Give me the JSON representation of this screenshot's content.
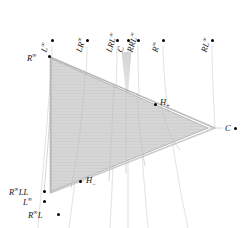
{
  "figure": {
    "width": 242,
    "height": 228,
    "background": "#ffffff",
    "fill_color": "#d4d4d4",
    "edge_color": "#9a9a9a",
    "curve_color": "#e2e2e2",
    "dot_color": "#000000",
    "wedge_color": "#d8d8d8"
  },
  "labels": {
    "top_row": [
      {
        "id": "L-inf",
        "base": "L",
        "sup": "∞",
        "sub": "",
        "x": 52,
        "y": 40
      },
      {
        "id": "LR-inf",
        "base": "LR",
        "sup": "∞",
        "sub": "",
        "x": 87,
        "y": 40
      },
      {
        "id": "LRL-inf",
        "base": "LRL",
        "sup": "∞",
        "sub": "",
        "x": 117,
        "y": 40
      },
      {
        "id": "C",
        "base": "C",
        "sup": "",
        "sub": "",
        "x": 128,
        "y": 40
      },
      {
        "id": "RRL-inf",
        "base": "RRL",
        "sup": "∞",
        "sub": "",
        "x": 138,
        "y": 40
      },
      {
        "id": "R-inf-top",
        "base": "R",
        "sup": "∞",
        "sub": "",
        "x": 163,
        "y": 40
      },
      {
        "id": "RL-inf",
        "base": "RL",
        "sup": "∞",
        "sub": "",
        "x": 212,
        "y": 40
      }
    ],
    "vertices": [
      {
        "id": "R-inf-vertex",
        "base": "R",
        "sup": "∞",
        "sub": "",
        "x": 44,
        "y": 57
      },
      {
        "id": "C-right",
        "base": "C",
        "sup": "",
        "sub": "",
        "x": 226,
        "y": 129
      }
    ],
    "interior": [
      {
        "id": "H-plus",
        "base": "H",
        "sup": "",
        "sub": "+",
        "x": 156,
        "y": 104
      },
      {
        "id": "H-minus",
        "base": "H",
        "sup": "",
        "sub": "−",
        "x": 82,
        "y": 181
      }
    ],
    "bottom_left": [
      {
        "id": "R-inf-LL",
        "base": "R",
        "sup": "∞",
        "sub": "",
        "tail": "LL",
        "x": 36,
        "y": 192
      },
      {
        "id": "L-inf-bl",
        "base": "L",
        "sup": "∞",
        "sub": "",
        "tail": "",
        "x": 36,
        "y": 202
      },
      {
        "id": "R-inf-L",
        "base": "R",
        "sup": "∞",
        "sub": "",
        "tail": "L",
        "x": 50,
        "y": 215
      }
    ]
  },
  "text": {
    "L": "L",
    "R": "R",
    "C": "C",
    "H": "H",
    "LR": "LR",
    "RL": "RL",
    "LRL": "LRL",
    "RRL": "RRL",
    "LL": "LL",
    "infinity": "∞",
    "plus": "+",
    "minus": "−",
    "R_inf_LL": "LL",
    "R_inf_L": "L"
  },
  "geometry": {
    "triangle_outer": "M 50,57 L 215,128 L 50,193 Z",
    "triangle_inner": "M 52,60 L 206,128 L 53,190 Z",
    "wedge": "M 122,52 L 131,52 L 127,101 Z",
    "c_axis": "M 208,128 L 222,128",
    "curves": [
      "M 52,48 C 52,70 48,120 40,228",
      "M 87,48 C 87,75 80,140 70,228",
      "M 117,48 C 117,80 114,150 110,228",
      "M 128,48 C 128,80 128,150 128,228",
      "M 138,48 C 138,80 141,150 147,228",
      "M 163,48 C 163,80 172,150 186,228",
      "M 212,48 C 212,75 214,110 215,128"
    ]
  }
}
